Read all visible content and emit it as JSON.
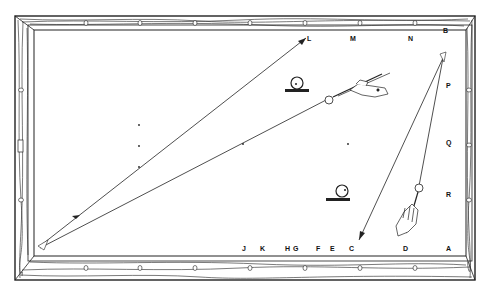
{
  "diagram": {
    "type": "billiard-table-shot-diagram",
    "colors": {
      "ink": "#222222",
      "paper": "#ffffff"
    },
    "rail_labels_top": [
      "L",
      "M",
      "N",
      "B"
    ],
    "rail_labels_right": [
      "P",
      "Q",
      "R"
    ],
    "rail_labels_bottom": [
      "J",
      "K",
      "H",
      "G",
      "F",
      "E",
      "C",
      "D",
      "A"
    ],
    "icons": [
      "ball-on-rail-icon-upper",
      "ball-on-rail-icon-lower",
      "hand-with-cue-icon-upper",
      "hand-with-cue-icon-lower"
    ]
  },
  "labels": {
    "L": "L",
    "M": "M",
    "N": "N",
    "B": "B",
    "P": "P",
    "Q": "Q",
    "R": "R",
    "J": "J",
    "K": "K",
    "H": "H",
    "G": "G",
    "F": "F",
    "E": "E",
    "C": "C",
    "D": "D",
    "A": "A"
  }
}
